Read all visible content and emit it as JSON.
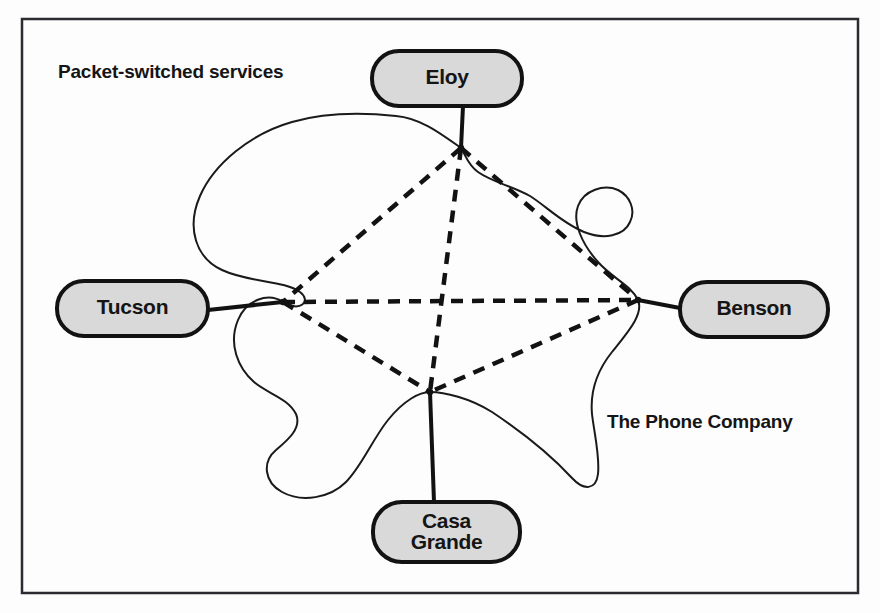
{
  "figure": {
    "kind": "network-cloud-diagram",
    "background_color": "#fdfdfd",
    "frame": {
      "name": "figure-border",
      "x": 22,
      "y": 19,
      "width": 836,
      "height": 574,
      "stroke": "#2b2b32",
      "stroke_width": 2.5
    }
  },
  "annotations": [
    {
      "id": "packet-switched-services",
      "text": "Packet-switched services",
      "x": 58,
      "y": 78,
      "anchor": "start"
    },
    {
      "id": "the-phone-company",
      "text": "The Phone Company",
      "x": 607,
      "y": 428,
      "anchor": "start"
    }
  ],
  "cloud": {
    "name": "phone-company-cloud",
    "stroke": "#1a1a1a",
    "stroke_width": 2,
    "fill": "none",
    "path": "M 461 148 C 440 133 420 118 396 116 C 358 112 320 114 292 122 C 250 134 214 164 200 196 C 186 228 196 258 222 270 C 250 283 284 280 300 292 C 312 301 300 313 283 302 C 268 292 246 300 238 320 C 228 344 238 368 254 382 C 268 394 288 398 296 414 C 302 428 288 440 276 450 C 262 462 264 482 282 492 C 302 503 330 498 346 482 C 362 466 372 440 388 420 C 404 400 420 392 430 392 C 444 392 470 398 492 412 C 516 428 548 452 572 478 C 584 491 596 490 598 474 C 600 456 594 432 592 414 C 590 392 596 372 612 352 C 628 332 644 314 638 300 C 632 286 612 278 598 262 C 582 244 572 222 578 206 C 584 190 604 184 618 190 C 630 196 636 210 630 222 C 624 236 604 240 584 232 C 562 223 546 206 530 196 C 512 186 492 182 478 172 C 468 165 466 156 461 148 Z"
  },
  "nodes": [
    {
      "id": "eloy",
      "label": "Eloy",
      "box": {
        "x": 372,
        "y": 51,
        "width": 150,
        "height": 55,
        "rx": 27
      },
      "fill": "#d9d9d9",
      "stroke": "#121212",
      "stroke_width": 4,
      "hub": {
        "x": 461,
        "y": 148
      },
      "stem": {
        "x1": 463,
        "y1": 106,
        "x2": 461,
        "y2": 148
      }
    },
    {
      "id": "tucson",
      "label": "Tucson",
      "box": {
        "x": 57,
        "y": 281,
        "width": 151,
        "height": 55,
        "rx": 27
      },
      "fill": "#d9d9d9",
      "stroke": "#121212",
      "stroke_width": 4,
      "hub": {
        "x": 283,
        "y": 302
      },
      "stem": {
        "x1": 208,
        "y1": 310,
        "x2": 283,
        "y2": 302
      }
    },
    {
      "id": "benson",
      "label": "Benson",
      "box": {
        "x": 680,
        "y": 282,
        "width": 148,
        "height": 55,
        "rx": 27
      },
      "fill": "#d9d9d9",
      "stroke": "#121212",
      "stroke_width": 4,
      "hub": {
        "x": 638,
        "y": 300
      },
      "stem": {
        "x1": 680,
        "y1": 308,
        "x2": 638,
        "y2": 300
      }
    },
    {
      "id": "casa-grande",
      "label": "Casa Grande",
      "label_lines": [
        "Casa",
        "Grande"
      ],
      "box": {
        "x": 373,
        "y": 502,
        "width": 147,
        "height": 60,
        "rx": 29
      },
      "fill": "#d9d9d9",
      "stroke": "#121212",
      "stroke_width": 4,
      "hub": {
        "x": 430,
        "y": 392
      },
      "stem": {
        "x1": 434,
        "y1": 502,
        "x2": 430,
        "y2": 392
      }
    }
  ],
  "virtual_circuits": {
    "style": {
      "stroke": "#121212",
      "stroke_width": 4.5,
      "dash": "12 9"
    },
    "links": [
      {
        "id": "eloy-tucson",
        "from": "eloy",
        "to": "tucson",
        "x1": 461,
        "y1": 148,
        "x2": 283,
        "y2": 302
      },
      {
        "id": "eloy-benson",
        "from": "eloy",
        "to": "benson",
        "x1": 461,
        "y1": 148,
        "x2": 638,
        "y2": 300
      },
      {
        "id": "eloy-casa-grande",
        "from": "eloy",
        "to": "casa-grande",
        "x1": 461,
        "y1": 148,
        "x2": 430,
        "y2": 392
      },
      {
        "id": "tucson-benson",
        "from": "tucson",
        "to": "benson",
        "x1": 283,
        "y1": 302,
        "x2": 638,
        "y2": 300
      },
      {
        "id": "tucson-casa-grande",
        "from": "tucson",
        "to": "casa-grande",
        "x1": 283,
        "y1": 302,
        "x2": 430,
        "y2": 392
      },
      {
        "id": "benson-casa-grande",
        "from": "benson",
        "to": "casa-grande",
        "x1": 638,
        "y1": 300,
        "x2": 430,
        "y2": 392
      }
    ]
  }
}
